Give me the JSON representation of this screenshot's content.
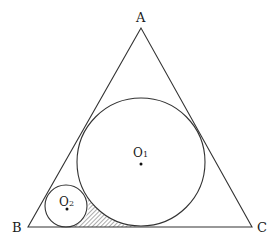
{
  "diagram": {
    "type": "geometry",
    "vertices": {
      "A": {
        "label": "A",
        "x": 141,
        "y": 28
      },
      "B": {
        "label": "B",
        "x": 28,
        "y": 227
      },
      "C": {
        "label": "C",
        "x": 252,
        "y": 227
      }
    },
    "circles": [
      {
        "name": "O1",
        "label": "O",
        "subscript": "1",
        "cx": 141,
        "cy": 162,
        "r": 64
      },
      {
        "name": "O2",
        "label": "O",
        "subscript": "2",
        "cx": 66,
        "cy": 206,
        "r": 21
      }
    ],
    "shaded_region": "area bounded by circle O2, circle O1 and segment BC",
    "colors": {
      "stroke": "#333333",
      "hatch": "#444444",
      "background": "#ffffff"
    }
  }
}
